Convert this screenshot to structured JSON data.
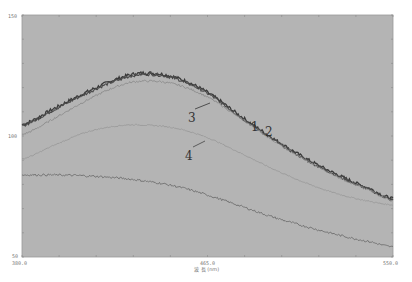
{
  "chart_data": {
    "type": "line",
    "title": "",
    "xlabel": "波 長 (nm)",
    "ylabel": "",
    "xlim": [
      380.0,
      550.0
    ],
    "ylim": [
      50,
      150
    ],
    "grid": false,
    "legend": "inline numeric labels",
    "x_ticks": [
      "380.0",
      "465.0",
      "550.0"
    ],
    "y_ticks": [
      "150",
      "100",
      "50"
    ],
    "plot_background": "#b4b4b4",
    "series": [
      {
        "name": "1",
        "color": "#3a3a3a",
        "x": [
          380,
          395,
          410,
          425,
          436,
          450,
          465,
          480,
          495,
          510,
          525,
          540,
          550
        ],
        "y": [
          104.7,
          111.5,
          118.3,
          124.0,
          126.0,
          124.3,
          118.0,
          108.3,
          99.0,
          90.7,
          83.8,
          78.0,
          74.0
        ]
      },
      {
        "name": "2",
        "color": "#4a4a4a",
        "x": [
          380,
          395,
          410,
          425,
          436,
          450,
          465,
          480,
          495,
          510,
          525,
          540,
          550
        ],
        "y": [
          104.3,
          111.0,
          117.8,
          123.4,
          125.5,
          123.8,
          117.6,
          107.9,
          98.6,
          90.3,
          83.4,
          77.6,
          73.6
        ]
      },
      {
        "name": "3",
        "color": "#8a8a8a",
        "x": [
          380,
          395,
          410,
          425,
          436,
          450,
          465,
          480,
          495,
          510,
          525,
          540,
          550
        ],
        "y": [
          100.6,
          107.4,
          114.9,
          120.9,
          122.7,
          121.4,
          116.1,
          107.4,
          98.2,
          90.0,
          83.0,
          77.3,
          73.3
        ]
      },
      {
        "name": "4",
        "color": "#9a9a9a",
        "x": [
          380,
          395,
          410,
          425,
          436,
          450,
          465,
          480,
          495,
          510,
          525,
          540,
          550
        ],
        "y": [
          90.5,
          96.3,
          101.7,
          104.3,
          104.5,
          103.3,
          99.3,
          93.0,
          86.4,
          80.6,
          76.0,
          72.9,
          71.5
        ]
      },
      {
        "name": "5",
        "color": "#6e6e6e",
        "x": [
          380,
          395,
          410,
          425,
          436,
          450,
          465,
          480,
          495,
          510,
          525,
          540,
          550
        ],
        "y": [
          83.9,
          83.9,
          83.5,
          82.6,
          81.4,
          79.3,
          75.6,
          71.1,
          66.5,
          62.6,
          59.1,
          56.2,
          54.1
        ]
      }
    ],
    "annotations": [
      {
        "text": "1",
        "x_px": 251,
        "y_px": 131
      },
      {
        "text": "2",
        "x_px": 265,
        "y_px": 136
      },
      {
        "text": "3",
        "x_px": 188,
        "y_px": 122
      },
      {
        "text": "4",
        "x_px": 185,
        "y_px": 160
      }
    ]
  }
}
